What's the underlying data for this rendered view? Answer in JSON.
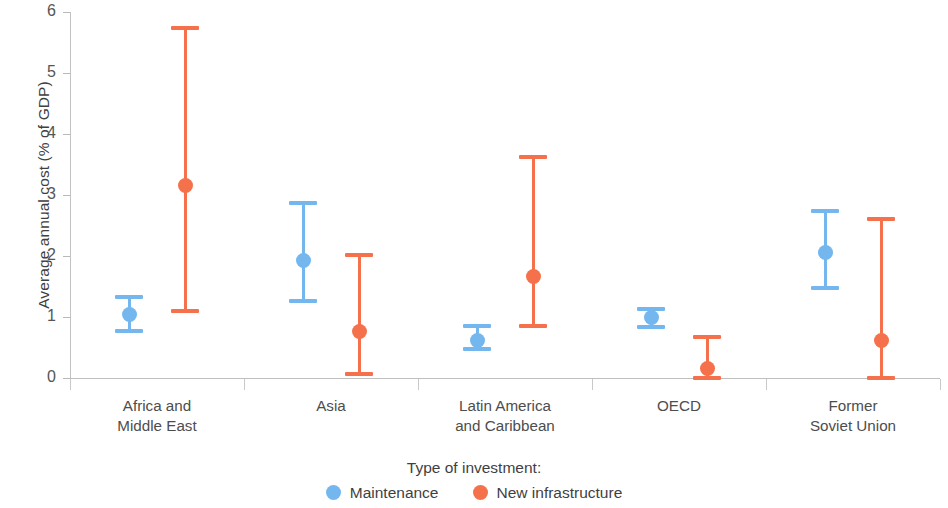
{
  "chart_data": {
    "type": "scatter",
    "title": "",
    "xlabel": "",
    "ylabel": "Average annual cost (% of GDP)",
    "ylim": [
      0,
      6
    ],
    "yticks": [
      0,
      1,
      2,
      3,
      4,
      5,
      6
    ],
    "ytick_labels": [
      "0",
      "1",
      "2",
      "3",
      "4",
      "5",
      "6"
    ],
    "grid": false,
    "legend_position": "bottom-center",
    "legend_title": "Type of investment:",
    "categories": [
      "Africa and\nMiddle East",
      "Asia",
      "Latin America\nand Caribbean",
      "OECD",
      "Former\nSoviet Union"
    ],
    "series": [
      {
        "name": "Maintenance",
        "color": "#74b7ee",
        "values": [
          1.04,
          1.92,
          0.62,
          0.99,
          2.05
        ],
        "low": [
          0.77,
          1.26,
          0.48,
          0.84,
          1.48
        ],
        "high": [
          1.33,
          2.87,
          0.86,
          1.13,
          2.74
        ]
      },
      {
        "name": "New infrastructure",
        "color": "#f5714c",
        "values": [
          3.16,
          0.76,
          1.66,
          0.16,
          0.62
        ],
        "low": [
          1.1,
          0.07,
          0.85,
          0.0,
          0.0
        ],
        "high": [
          5.73,
          2.01,
          3.62,
          0.68,
          2.6
        ]
      }
    ]
  },
  "legend": {
    "title": "Type of investment:",
    "items": [
      {
        "label": "Maintenance",
        "color": "#74b7ee"
      },
      {
        "label": "New infrastructure",
        "color": "#f5714c"
      }
    ]
  },
  "axis": {
    "y_title": "Average annual cost (% of GDP)"
  }
}
